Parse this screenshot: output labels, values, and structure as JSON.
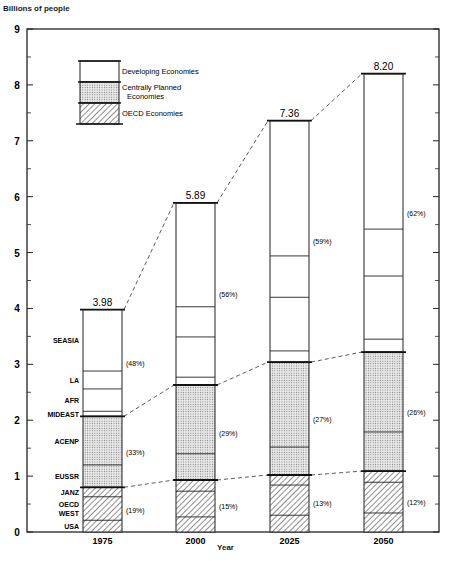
{
  "chart_data": {
    "type": "bar",
    "subtype": "stacked",
    "title": "",
    "xlabel": "Year",
    "ylabel": "Billions of people",
    "ylim": [
      0,
      9
    ],
    "yticks": [
      0,
      1,
      2,
      3,
      4,
      5,
      6,
      7,
      8,
      9
    ],
    "grid": false,
    "categories": [
      "1975",
      "2000",
      "2025",
      "2050"
    ],
    "totals": [
      3.98,
      5.89,
      7.36,
      8.2
    ],
    "total_labels": [
      "3.98",
      "5.89",
      "7.36",
      "8.20"
    ],
    "groups": [
      {
        "name": "OECD Economies",
        "pattern": "hatched",
        "regions": [
          "USA",
          "OECD WEST",
          "JANZ"
        ],
        "values": [
          0.8,
          0.93,
          1.02,
          1.09
        ],
        "share_labels": [
          "(19%)",
          "(15%)",
          "(13%)",
          "(12%)"
        ]
      },
      {
        "name": "Centrally Planned Economies",
        "pattern": "dotted",
        "regions": [
          "EUSSR",
          "ACENP"
        ],
        "values": [
          1.27,
          1.7,
          2.02,
          2.13
        ],
        "share_labels": [
          "(33%)",
          "(29%)",
          "(27%)",
          "(26%)"
        ]
      },
      {
        "name": "Developing Economies",
        "pattern": "blank",
        "regions": [
          "MIDEAST",
          "AFR",
          "LA",
          "SEASIA"
        ],
        "values": [
          1.91,
          3.26,
          4.32,
          4.98
        ],
        "share_labels": [
          "(48%)",
          "(56%)",
          "(59%)",
          "(62%)"
        ]
      }
    ],
    "series": [
      {
        "name": "USA",
        "group": "OECD Economies",
        "values": [
          0.21,
          0.27,
          0.3,
          0.34
        ]
      },
      {
        "name": "OECD WEST",
        "group": "OECD Economies",
        "values": [
          0.42,
          0.46,
          0.54,
          0.55
        ]
      },
      {
        "name": "JANZ",
        "group": "OECD Economies",
        "values": [
          0.17,
          0.2,
          0.18,
          0.2
        ]
      },
      {
        "name": "EUSSR",
        "group": "Centrally Planned Economies",
        "values": [
          0.4,
          0.47,
          0.5,
          0.7
        ]
      },
      {
        "name": "ACENP",
        "group": "Centrally Planned Economies",
        "values": [
          0.87,
          1.23,
          1.52,
          1.43
        ]
      },
      {
        "name": "MIDEAST",
        "group": "Developing Economies",
        "values": [
          0.09,
          0.14,
          0.2,
          0.23
        ]
      },
      {
        "name": "AFR",
        "group": "Developing Economies",
        "values": [
          0.4,
          0.72,
          0.96,
          1.13
        ]
      },
      {
        "name": "LA",
        "group": "Developing Economies",
        "values": [
          0.32,
          0.54,
          0.74,
          0.84
        ]
      },
      {
        "name": "SEASIA",
        "group": "Developing Economies",
        "values": [
          1.1,
          1.86,
          2.42,
          2.78
        ]
      }
    ],
    "region_labels_on_1975": [
      "SEASIA",
      "LA",
      "AFR",
      "MIDEAST",
      "ACENP",
      "EUSSR",
      "JANZ",
      "OECD WEST",
      "USA"
    ],
    "legend": {
      "position": "upper left inside",
      "entries": [
        "Developing Economies",
        "Centrally Planned Economies",
        "OECD Economies"
      ]
    }
  },
  "labels": {
    "ylabel": "Billions of people",
    "xlabel": "Year",
    "legend_developing": "Developing Economies",
    "legend_cpe_1": "Centrally Planned",
    "legend_cpe_2": "Economies",
    "legend_oecd": "OECD Economies"
  }
}
